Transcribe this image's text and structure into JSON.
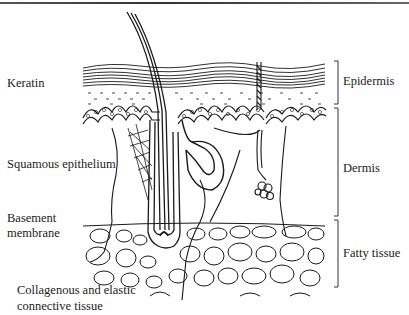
{
  "diagram": {
    "type": "anatomical cross-section",
    "left_labels": [
      {
        "text": "Keratin"
      },
      {
        "text": "Squamous epithelium"
      },
      {
        "lines": [
          "Basement",
          "membrane"
        ]
      },
      {
        "lines": [
          "Collagenous and elastic",
          "connective tissue"
        ]
      }
    ],
    "right_labels": [
      {
        "text": "Epidermis"
      },
      {
        "text": "Dermis"
      },
      {
        "text": "Fatty tissue"
      }
    ],
    "structures": [
      "hair shaft",
      "hair follicle",
      "sebaceous gland",
      "sweat gland",
      "sweat duct",
      "arrector pili muscle",
      "fat cells"
    ],
    "colors": {
      "ink": "#1a1a1a",
      "background": "#ffffff"
    }
  }
}
